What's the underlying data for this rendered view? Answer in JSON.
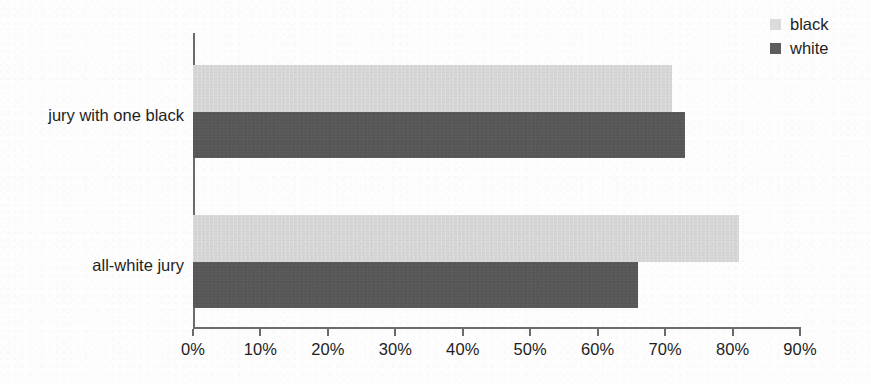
{
  "chart_data": {
    "type": "bar",
    "orientation": "horizontal",
    "title": "",
    "subtitle": "",
    "xlabel": "",
    "ylabel": "",
    "categories": [
      "jury with one black",
      "all-white jury"
    ],
    "series": [
      {
        "name": "black",
        "color": "#d6d6d6",
        "values": [
          71,
          81
        ]
      },
      {
        "name": "white",
        "color": "#585858",
        "values": [
          73,
          66
        ]
      }
    ],
    "xlim": [
      0,
      90
    ],
    "xtick_values": [
      0,
      10,
      20,
      30,
      40,
      50,
      60,
      70,
      80,
      90
    ],
    "xtick_labels": [
      "0%",
      "10%",
      "20%",
      "30%",
      "40%",
      "50%",
      "60%",
      "70%",
      "80%",
      "90%"
    ],
    "value_unit": "percent",
    "grid": false,
    "legend_position": "top-right",
    "legend_entries": [
      "black",
      "white"
    ],
    "annotations": []
  },
  "legend": {
    "entries": [
      {
        "label": "black",
        "swatch_color": "#dcdcdc"
      },
      {
        "label": "white",
        "swatch_color": "#5e5e5e"
      }
    ]
  },
  "axes": {
    "x": {
      "ticks": [
        {
          "label": "0%",
          "value": 0
        },
        {
          "label": "10%",
          "value": 10
        },
        {
          "label": "20%",
          "value": 20
        },
        {
          "label": "30%",
          "value": 30
        },
        {
          "label": "40%",
          "value": 40
        },
        {
          "label": "50%",
          "value": 50
        },
        {
          "label": "60%",
          "value": 60
        },
        {
          "label": "70%",
          "value": 70
        },
        {
          "label": "80%",
          "value": 80
        },
        {
          "label": "90%",
          "value": 90
        }
      ]
    },
    "y": {
      "categories": [
        {
          "label": "jury with one black"
        },
        {
          "label": "all-white jury"
        }
      ]
    }
  },
  "colors": {
    "black_series": "#d6d6d6",
    "white_series": "#585858",
    "axis": "#6b6b6b",
    "text": "#1f1f1f",
    "background": "#fdfdfd"
  }
}
